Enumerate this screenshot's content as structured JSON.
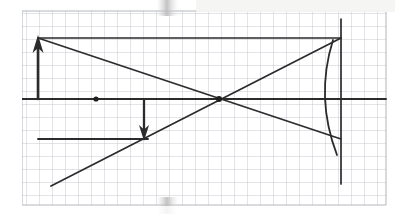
{
  "page": {
    "kind": "scanned-worksheet-photo",
    "width": 395,
    "height": 214,
    "background_color": "#ffffff"
  },
  "colors": {
    "paper": "#ffffff",
    "grid_minor": "#b9bcc6",
    "grid_major": "#6f7480",
    "ink": "#2b2b2b",
    "ink_soft": "#4a4a4a",
    "scan_shadow": "#d8d8d8",
    "scan_highlight": "#f4f4f2"
  },
  "grid": {
    "label": "graph-paper-grid",
    "origin_x": 22,
    "origin_y": 11,
    "right_x": 386,
    "bottom_y": 205,
    "cell_size": 13.0,
    "columns": 28,
    "rows": 15,
    "minor_stroke_width": 0.7,
    "major_every": 1
  },
  "chart_data": {
    "type": "scatter",
    "title": "Concave mirror ray diagram",
    "xlabel": "",
    "ylabel": "",
    "grid": true,
    "legend_position": "none",
    "axis_ranges": {
      "x_px": [
        22,
        386
      ],
      "y_px": [
        11,
        205
      ]
    },
    "annotations": [
      "principal axis drawn horizontally across the full grid",
      "object: upright arrow at left of the axis",
      "image: inverted arrow below the axis",
      "concave mirror: arc opening to the left at the right edge",
      "mirror plane: vertical line through the mirror vertex",
      "centre of curvature / focal dot marked on the axis",
      "rays cross on the axis at the focal point"
    ],
    "points": [
      {
        "name": "focal-point-dot",
        "x_px": 96,
        "y_px": 99
      },
      {
        "name": "ray-crossing-dot",
        "x_px": 219,
        "y_px": 99
      }
    ],
    "segments": [
      {
        "name": "principal-axis",
        "x1": 22,
        "y1": 99,
        "x2": 386,
        "y2": 99
      },
      {
        "name": "object-arrow-shaft",
        "x1": 38,
        "y1": 99,
        "x2": 38,
        "y2": 42
      },
      {
        "name": "image-arrow-shaft",
        "x1": 144,
        "y1": 100,
        "x2": 144,
        "y2": 133
      },
      {
        "name": "object-top-ray",
        "x1": 38,
        "y1": 38,
        "x2": 341,
        "y2": 38
      },
      {
        "name": "image-bottom-ray",
        "x1": 38,
        "y1": 139,
        "x2": 148,
        "y2": 139
      },
      {
        "name": "reflected-ray-down",
        "x1": 38,
        "y1": 38,
        "x2": 341,
        "y2": 139
      },
      {
        "name": "reflected-ray-up",
        "x1": 51,
        "y1": 186,
        "x2": 341,
        "y2": 38
      },
      {
        "name": "mirror-plane-line",
        "x1": 341,
        "y1": 19,
        "x2": 341,
        "y2": 184
      }
    ],
    "arcs": [
      {
        "name": "concave-mirror-arc",
        "start_x": 333,
        "start_y": 40,
        "end_x": 337,
        "end_y": 155,
        "bulge": "left",
        "radius_px": 130
      }
    ],
    "arrow_heads": [
      {
        "name": "object-arrow-head",
        "tip_x": 38,
        "tip_y": 35,
        "direction": "up",
        "width": 11,
        "length": 18
      },
      {
        "name": "image-arrow-head",
        "tip_x": 144,
        "tip_y": 141,
        "direction": "down",
        "width": 10,
        "length": 16
      }
    ]
  },
  "scan_artifacts": [
    {
      "name": "top-edge-shadow-band",
      "x": 157,
      "y": 0,
      "width": 22,
      "height": 16
    },
    {
      "name": "bottom-edge-shadow-band",
      "x": 157,
      "y": 198,
      "width": 22,
      "height": 16
    },
    {
      "name": "top-right-wash",
      "x": 196,
      "y": 0,
      "width": 199,
      "height": 11
    }
  ]
}
